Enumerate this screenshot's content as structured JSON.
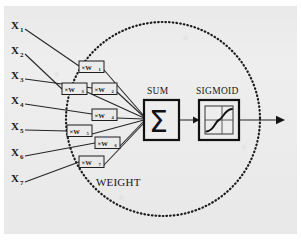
{
  "figure": {
    "background_color": "#eeeeee",
    "ink_color": "#1a1a1a"
  },
  "inputs": [
    {
      "name": "X",
      "sub": "1",
      "label": "X₁"
    },
    {
      "name": "X",
      "sub": "2",
      "label": "X₂"
    },
    {
      "name": "X",
      "sub": "3",
      "label": "X₃"
    },
    {
      "name": "X",
      "sub": "4",
      "label": "X₄"
    },
    {
      "name": "X",
      "sub": "5",
      "label": "X₅"
    },
    {
      "name": "X",
      "sub": "6",
      "label": "X₆"
    },
    {
      "name": "X",
      "sub": "7",
      "label": "X₇"
    }
  ],
  "weights": [
    {
      "symbol": "×W",
      "sub": "1",
      "label": "×W₁"
    },
    {
      "symbol": "×W",
      "sub": "2",
      "label": "×W₂"
    },
    {
      "symbol": "×W",
      "sub": "3",
      "label": "×W₃"
    },
    {
      "symbol": "×W",
      "sub": "4",
      "label": "×W₄"
    },
    {
      "symbol": "×W",
      "sub": "5",
      "label": "×W₅"
    },
    {
      "symbol": "×W",
      "sub": "6",
      "label": "×W₆"
    },
    {
      "symbol": "×W",
      "sub": "7",
      "label": "×W₇"
    }
  ],
  "annotations": {
    "weight_group": "WEIGHT"
  },
  "blocks": {
    "sum": {
      "label": "SUM",
      "glyph": "Σ"
    },
    "sigmoid": {
      "label": "SIGMOID",
      "glyph": "s-curve-plot"
    }
  },
  "output": {
    "arrow": "output-arrow-right"
  },
  "neuron_boundary": {
    "style": "dotted-circle"
  }
}
